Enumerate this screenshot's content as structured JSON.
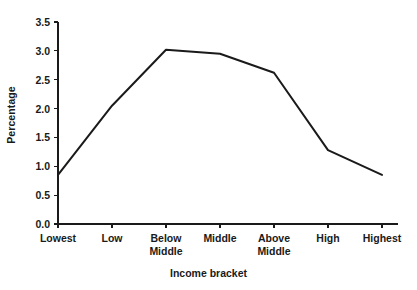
{
  "chart_data": {
    "type": "line",
    "title": "",
    "xlabel": "Income bracket",
    "ylabel": "Percentage",
    "categories": [
      "Lowest",
      "Low",
      "Below Middle",
      "Middle",
      "Above Middle",
      "High",
      "Highest"
    ],
    "category_lines": [
      [
        "Lowest",
        ""
      ],
      [
        "Low",
        ""
      ],
      [
        "Below",
        "Middle"
      ],
      [
        "Middle",
        ""
      ],
      [
        "Above",
        "Middle"
      ],
      [
        "High",
        ""
      ],
      [
        "Highest",
        ""
      ]
    ],
    "values": [
      0.85,
      2.05,
      3.02,
      2.95,
      2.62,
      1.28,
      0.85
    ],
    "series": [
      {
        "name": "Percentage",
        "values": [
          0.85,
          2.05,
          3.02,
          2.95,
          2.62,
          1.28,
          0.85
        ],
        "color": "#1a1a1a"
      }
    ],
    "ylim": [
      0.0,
      3.5
    ],
    "yticks": [
      0.0,
      0.5,
      1.0,
      1.5,
      2.0,
      2.5,
      3.0,
      3.5
    ],
    "ytick_labels": [
      "0.0",
      "0.5",
      "1.0",
      "1.5",
      "2.0",
      "2.5",
      "3.0",
      "3.5"
    ],
    "grid": false,
    "legend": "none",
    "markers": false,
    "line_color": "#1a1a1a",
    "line_width": 2,
    "background_color": "#ffffff",
    "axis_color": "#1a1a1a"
  }
}
